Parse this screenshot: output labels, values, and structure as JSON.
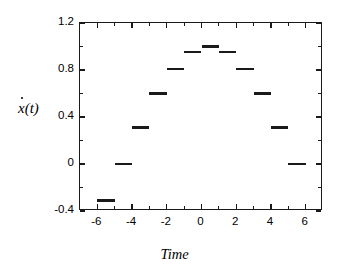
{
  "chart_data": {
    "type": "line",
    "subtype": "step-piecewise-constant",
    "title": "",
    "xlabel": "Time",
    "ylabel": "ẋ(t)",
    "ylabel_plain": "xdot(t)",
    "xlim": [
      -7,
      7
    ],
    "ylim": [
      -0.4,
      1.2
    ],
    "grid": false,
    "legend": null,
    "xticks": [
      -6,
      -4,
      -2,
      0,
      2,
      4,
      6
    ],
    "xtick_labels": [
      "-6",
      "-4",
      "-2",
      "0",
      "2",
      "4",
      "6"
    ],
    "xminor_ticks": [
      -5,
      -3,
      -1,
      1,
      3,
      5
    ],
    "yticks": [
      -0.4,
      0,
      0.4,
      0.8,
      1.2
    ],
    "ytick_labels": [
      "-0.4",
      "0",
      "0.4",
      "0.8",
      "1.2"
    ],
    "yminor_ticks": [
      -0.2,
      0.2,
      0.6,
      1.0
    ],
    "segments": [
      {
        "x_start": -6,
        "x_end": -5,
        "value": -0.31
      },
      {
        "x_start": -5,
        "x_end": -4,
        "value": 0.0
      },
      {
        "x_start": -4,
        "x_end": -3,
        "value": 0.31
      },
      {
        "x_start": -3,
        "x_end": -2,
        "value": 0.6
      },
      {
        "x_start": -2,
        "x_end": -1,
        "value": 0.81
      },
      {
        "x_start": -1,
        "x_end": 0,
        "value": 0.95
      },
      {
        "x_start": 0,
        "x_end": 1,
        "value": 1.0
      },
      {
        "x_start": 1,
        "x_end": 2,
        "value": 0.95
      },
      {
        "x_start": 2,
        "x_end": 3,
        "value": 0.81
      },
      {
        "x_start": 3,
        "x_end": 4,
        "value": 0.6
      },
      {
        "x_start": 4,
        "x_end": 5,
        "value": 0.31
      },
      {
        "x_start": 5,
        "x_end": 6,
        "value": 0.0
      }
    ],
    "x": [
      -5.5,
      -4.5,
      -3.5,
      -2.5,
      -1.5,
      -0.5,
      0.5,
      1.5,
      2.5,
      3.5,
      4.5,
      5.5
    ],
    "values": [
      -0.31,
      0.0,
      0.31,
      0.6,
      0.81,
      0.95,
      1.0,
      0.95,
      0.81,
      0.6,
      0.31,
      0.0
    ],
    "colors": {
      "line": "#1a1a1a",
      "axis": "#1a1a1a",
      "background": "#ffffff"
    }
  }
}
